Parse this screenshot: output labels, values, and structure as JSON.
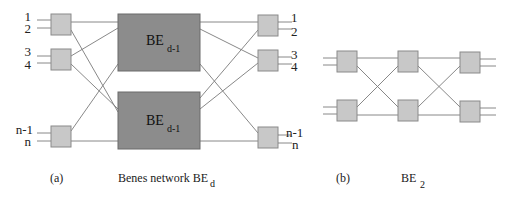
{
  "diagram_a": {
    "caption_tag": "(a)",
    "caption_title": "Benes network BE",
    "caption_sub": "d",
    "left_labels": [
      "1",
      "2",
      "3",
      "4",
      "n-1",
      "n"
    ],
    "right_labels": [
      "1",
      "2",
      "3",
      "4",
      "n-1",
      "n"
    ],
    "sub_networks": [
      {
        "label": "BE",
        "sub": "d-1"
      },
      {
        "label": "BE",
        "sub": "d-1"
      }
    ]
  },
  "diagram_b": {
    "caption_tag": "(b)",
    "caption_title": "BE",
    "caption_sub": "2"
  },
  "colors": {
    "switch_fill": "#c8c8c8",
    "subnetwork_fill": "#8c8c8c",
    "wire": "#7a7a7a"
  }
}
